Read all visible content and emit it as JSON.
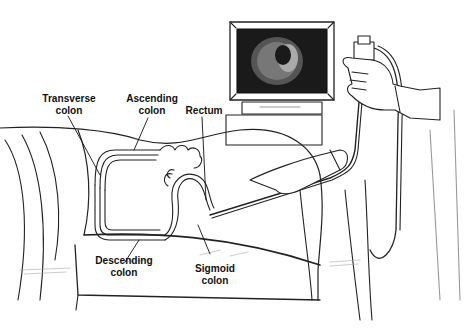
{
  "diagram": {
    "labels": {
      "transverse": {
        "line1": "Transverse",
        "line2": "colon"
      },
      "ascending": {
        "line1": "Ascending",
        "line2": "colon"
      },
      "rectum": {
        "line1": "Rectum"
      },
      "descending": {
        "line1": "Descending",
        "line2": "colon"
      },
      "sigmoid": {
        "line1": "Sigmoid",
        "line2": "colon"
      }
    },
    "elements": [
      "video-monitor",
      "colonoscope",
      "physician-hands",
      "patient-lying-on-side",
      "colon-anatomy",
      "examination-table"
    ],
    "colors": {
      "ink": "#111111",
      "background": "#ffffff",
      "screen": "#1a1a1a"
    }
  }
}
